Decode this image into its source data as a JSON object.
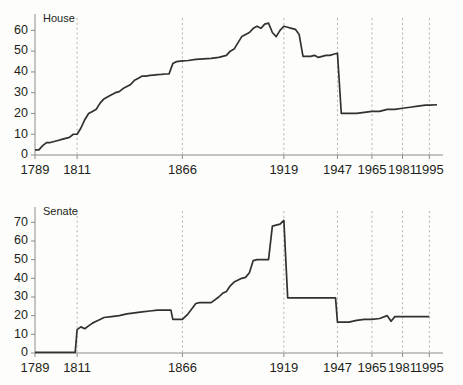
{
  "figure": {
    "panels": [
      {
        "id": "house",
        "title": "House",
        "ylabel": "",
        "xlabel": ""
      },
      {
        "id": "senate",
        "title": "Senate",
        "ylabel": "",
        "xlabel": ""
      }
    ]
  },
  "chart_data": [
    {
      "type": "line",
      "title": "House",
      "xlabel": "",
      "ylabel": "",
      "xlim": [
        1789,
        1999
      ],
      "ylim": [
        0,
        65
      ],
      "grid": false,
      "gridlines_vertical": [
        1811,
        1866,
        1919,
        1947,
        1965,
        1981,
        1995
      ],
      "xticks": [
        1789,
        1811,
        1866,
        1919,
        1947,
        1965,
        1981,
        1995
      ],
      "xticklabels": [
        "1789",
        "1811",
        "1866",
        "1919",
        "1947",
        "1965",
        "1981",
        "1995"
      ],
      "yticks": [
        0,
        10,
        20,
        30,
        40,
        50,
        60
      ],
      "yticklabels": [
        "0",
        "10",
        "20",
        "30",
        "40",
        "50",
        "60"
      ],
      "legend_position": "none",
      "series": [
        {
          "name": "House",
          "x": [
            1789,
            1791,
            1793,
            1795,
            1797,
            1799,
            1801,
            1803,
            1805,
            1807,
            1809,
            1811,
            1813,
            1815,
            1817,
            1819,
            1821,
            1823,
            1825,
            1827,
            1829,
            1831,
            1833,
            1835,
            1837,
            1839,
            1841,
            1843,
            1845,
            1847,
            1849,
            1851,
            1853,
            1855,
            1857,
            1859,
            1861,
            1863,
            1865,
            1866,
            1869,
            1873,
            1877,
            1881,
            1885,
            1889,
            1891,
            1893,
            1897,
            1901,
            1903,
            1905,
            1907,
            1909,
            1911,
            1913,
            1915,
            1917,
            1919,
            1921,
            1923,
            1925,
            1927,
            1929,
            1931,
            1933,
            1935,
            1937,
            1939,
            1941,
            1943,
            1945,
            1947,
            1949,
            1953,
            1957,
            1961,
            1965,
            1969,
            1973,
            1977,
            1981,
            1985,
            1989,
            1993,
            1995,
            1999
          ],
          "y": [
            2.5,
            2.5,
            4.5,
            6,
            6,
            6.5,
            7,
            7.5,
            8,
            8.5,
            10,
            10,
            13,
            17,
            20,
            21,
            22,
            25,
            27,
            28,
            29,
            30,
            30.5,
            32,
            33,
            34,
            36,
            37,
            38,
            38,
            38.3,
            38.5,
            38.7,
            38.8,
            39,
            39,
            44,
            45,
            45.2,
            45.3,
            45.5,
            46,
            46.3,
            46.5,
            47,
            48,
            50,
            51,
            57,
            59,
            61,
            62,
            61,
            63,
            63.5,
            59,
            57,
            60,
            62,
            61.5,
            61,
            60.5,
            58,
            47.5,
            47.5,
            47.5,
            48,
            47,
            47.5,
            48,
            48,
            48.5,
            49,
            20,
            20,
            20,
            20.5,
            21,
            21,
            22,
            22,
            22.5,
            23,
            23.5,
            24,
            24,
            24.2,
            21.5
          ]
        }
      ]
    },
    {
      "type": "line",
      "title": "Senate",
      "xlabel": "",
      "ylabel": "",
      "xlim": [
        1789,
        1999
      ],
      "ylim": [
        0,
        75
      ],
      "grid": false,
      "gridlines_vertical": [
        1811,
        1866,
        1919,
        1947,
        1965,
        1981,
        1995
      ],
      "xticks": [
        1789,
        1811,
        1866,
        1919,
        1947,
        1965,
        1981,
        1995
      ],
      "xticklabels": [
        "1789",
        "1811",
        "1866",
        "1919",
        "1947",
        "1965",
        "1981",
        "1995"
      ],
      "yticks": [
        0,
        10,
        20,
        30,
        40,
        50,
        60,
        70
      ],
      "yticklabels": [
        "0",
        "10",
        "20",
        "30",
        "40",
        "50",
        "60",
        "70"
      ],
      "legend_position": "none",
      "series": [
        {
          "name": "Senate",
          "x": [
            1789,
            1795,
            1801,
            1805,
            1809,
            1810,
            1811,
            1813,
            1815,
            1817,
            1819,
            1821,
            1823,
            1825,
            1829,
            1833,
            1837,
            1841,
            1845,
            1849,
            1853,
            1857,
            1859,
            1860,
            1861,
            1863,
            1866,
            1869,
            1873,
            1875,
            1879,
            1881,
            1885,
            1887,
            1889,
            1891,
            1893,
            1897,
            1899,
            1901,
            1903,
            1905,
            1907,
            1909,
            1911,
            1913,
            1915,
            1917,
            1919,
            1921,
            1923,
            1929,
            1935,
            1941,
            1945,
            1946,
            1947,
            1949,
            1953,
            1957,
            1961,
            1965,
            1969,
            1973,
            1975,
            1977,
            1979,
            1981,
            1983,
            1985,
            1989,
            1995,
            1999
          ],
          "y": [
            0.3,
            0.3,
            0.3,
            0.3,
            0.3,
            0.3,
            12.5,
            14,
            13,
            14.5,
            16,
            17,
            18,
            19,
            19.5,
            20,
            21,
            21.5,
            22,
            22.5,
            23,
            23,
            23,
            23,
            18,
            18,
            18,
            21,
            26.5,
            27,
            27,
            27,
            30,
            32,
            33,
            36,
            38,
            40,
            40.5,
            43,
            49.5,
            50,
            50,
            50,
            50,
            68,
            68.5,
            69,
            71,
            29.5,
            29.5,
            29.5,
            29.5,
            29.5,
            29.5,
            29.5,
            16.5,
            16.5,
            16.5,
            17.5,
            18,
            18,
            18.5,
            20,
            17,
            19.5,
            19.5,
            19.5,
            19.5,
            19.5,
            19.5,
            19.5
          ]
        }
      ]
    }
  ]
}
